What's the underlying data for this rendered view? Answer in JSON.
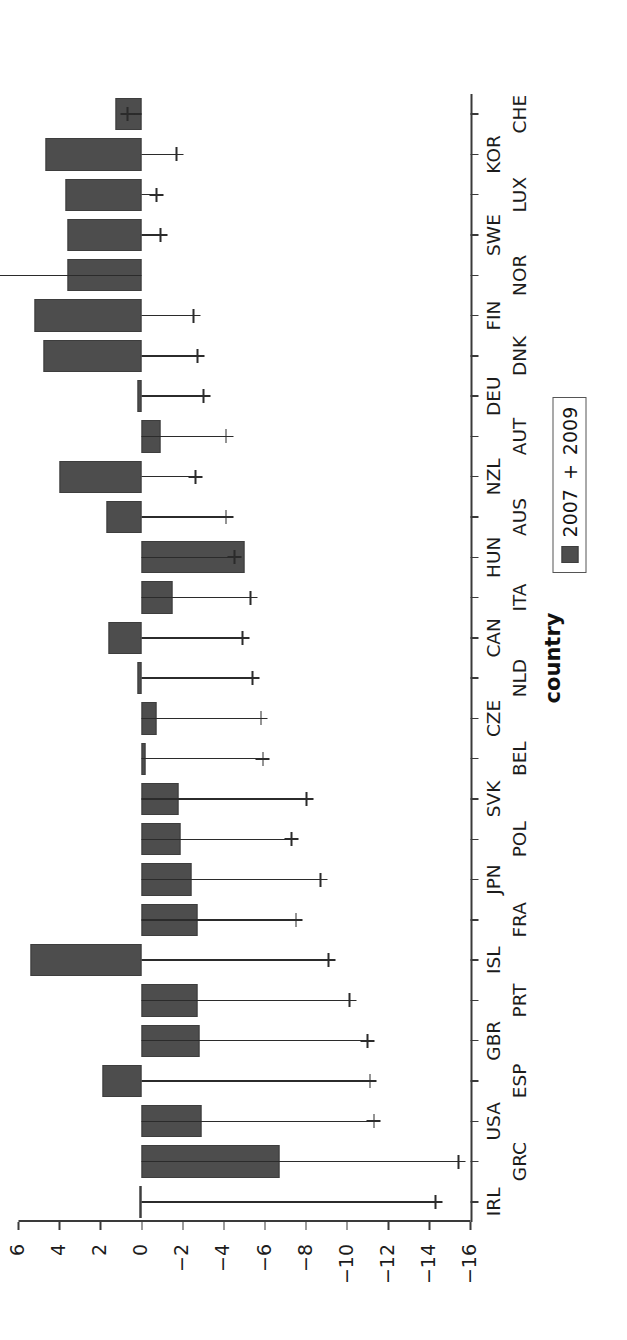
{
  "chart_data": {
    "type": "bar",
    "title": "",
    "xlabel": "country",
    "ylabel": "percentage of GDP",
    "ylim": [
      -16,
      6
    ],
    "yticks": [
      6,
      4,
      2,
      0,
      -2,
      -4,
      -6,
      -8,
      -10,
      -12,
      -14,
      -16
    ],
    "ytick_labels": [
      "6",
      "4",
      "2",
      "0",
      "−2",
      "−4",
      "−6",
      "−8",
      "−10",
      "−12",
      "−14",
      "−16"
    ],
    "grid": false,
    "orientation": "rotated-90",
    "legend_position": "bottom-right",
    "legend": [
      {
        "name": "2007",
        "marker": "filled-square",
        "color": "#4d4d4d"
      },
      {
        "name": "2009",
        "marker": "plus",
        "color": "#2b2b2b"
      }
    ],
    "categories": [
      "IRL",
      "GRC",
      "USA",
      "ESP",
      "GBR",
      "PRT",
      "ISL",
      "FRA",
      "JPN",
      "POL",
      "SVK",
      "BEL",
      "CZE",
      "NLD",
      "CAN",
      "ITA",
      "HUN",
      "AUS",
      "NZL",
      "AUT",
      "DEU",
      "DNK",
      "FIN",
      "NOR",
      "SWE",
      "LUX",
      "KOR",
      "CHE"
    ],
    "series": [
      {
        "name": "2007",
        "marker": "filled-square",
        "values": [
          0.1,
          -6.7,
          -2.9,
          1.9,
          -2.8,
          -2.7,
          5.4,
          -2.7,
          -2.4,
          -1.9,
          -1.8,
          -0.2,
          -0.7,
          0.2,
          1.6,
          -1.5,
          -5.0,
          1.7,
          4.0,
          -0.9,
          0.2,
          4.8,
          5.2,
          3.6,
          3.6,
          3.7,
          4.7,
          1.3
        ]
      },
      {
        "name": "2009",
        "marker": "plus",
        "values": [
          -14.3,
          -15.4,
          -11.3,
          -11.1,
          -11.0,
          -10.1,
          -9.1,
          -7.5,
          -8.7,
          -7.3,
          -8.0,
          -5.9,
          -5.8,
          -5.4,
          -4.9,
          -5.3,
          -4.5,
          -4.1,
          -2.6,
          -4.1,
          -3.0,
          -2.7,
          -2.5,
          9.7,
          -0.9,
          -0.7,
          -1.7,
          0.7
        ]
      }
    ]
  },
  "notes": {
    "bar_series_index": 0,
    "marker_series_index": 1
  }
}
